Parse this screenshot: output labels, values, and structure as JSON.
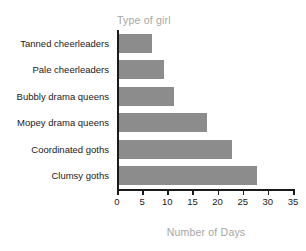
{
  "chart_data": {
    "type": "bar",
    "orientation": "horizontal",
    "title": "Type of girl",
    "xlabel": "Number of Days",
    "ylabel": "Type of girl",
    "categories": [
      "Tanned cheerleaders",
      "Pale cheerleaders",
      "Bubbly drama queens",
      "Mopey drama queens",
      "Coordinated goths",
      "Clumsy goths"
    ],
    "values": [
      6.5,
      9,
      11,
      17.5,
      22.5,
      27.5
    ],
    "xlim": [
      0,
      35
    ],
    "xticks": [
      0,
      5,
      10,
      15,
      20,
      25,
      30,
      35
    ],
    "xtick_labels": [
      "0",
      "5",
      "10",
      "15",
      "20",
      "25",
      "30",
      "35"
    ],
    "grid": false,
    "legend": false,
    "bar_color": "#8c8c8c",
    "axis_color": "#1a1a1a",
    "title_color": "#a6a6a6",
    "label_color": "#1a1a1a",
    "background": "#ffffff"
  }
}
